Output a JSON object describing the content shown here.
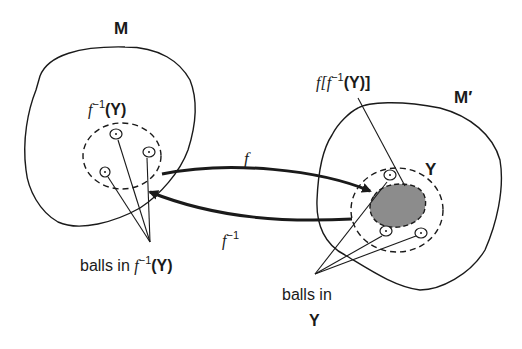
{
  "diagram": {
    "labels": {
      "space_m": "M",
      "space_m_prime": "M′",
      "preimage_f": "f",
      "preimage_sup": "−1",
      "preimage_arg": "(Y)",
      "image_label_prefix": "f[f",
      "image_label_sup": "−1",
      "image_label_suffix": "(Y)]",
      "set_y": "Y",
      "arrow_forward": "f",
      "arrow_inverse_f": "f",
      "arrow_inverse_sup": "−1",
      "balls_left_text": "balls in ",
      "balls_left_f": "f",
      "balls_left_sup": "−1",
      "balls_left_arg": "(Y)",
      "balls_right_line1": "balls in",
      "balls_right_line2": "Y"
    },
    "colors": {
      "stroke": "#1a1a1a",
      "shaded_region": "#8c8c8c",
      "background": "#ffffff"
    }
  }
}
